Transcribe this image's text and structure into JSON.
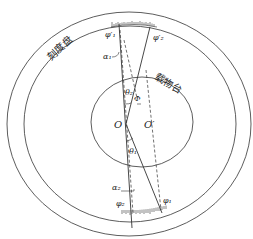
{
  "diagram": {
    "type": "spectrometer-eccentricity-geometry",
    "labels": {
      "dial": "刻度盘",
      "stage": "载物台",
      "center_O": "O",
      "center_O_prime": "O′",
      "phi1_prime": "φ′₁",
      "phi2_prime": "φ′₂",
      "phi1": "φ₁",
      "phi2": "φ₂",
      "alpha1": "α₁",
      "alpha2": "α₂",
      "theta1": "θ₁",
      "theta2": "θ₂",
      "Phi": "Φ"
    },
    "colors": {
      "stroke": "#333333",
      "background": "#ffffff"
    }
  }
}
